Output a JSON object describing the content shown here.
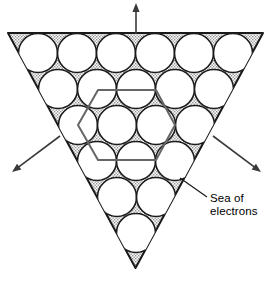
{
  "figure": {
    "background_color": "#ffffff",
    "outline_color": "#1a1a1a",
    "sea_fill_color": "#a8a8a8",
    "sea_fill_description": "stippled gray shading filling gaps between atoms",
    "atom_fill_color": "#ffffff",
    "unit_cell_color": "#666666",
    "arrow_color": "#3a3a3a"
  },
  "triangle": {
    "orientation": "inverted",
    "vertices": [
      {
        "x": 8,
        "y": 33
      },
      {
        "x": 263,
        "y": 33
      },
      {
        "x": 135.5,
        "y": 268
      }
    ]
  },
  "lattice": {
    "description": "close-packed hexagonal array of metal atoms",
    "radius": 19.5,
    "row_spacing": 34,
    "rows": [
      {
        "count": 6,
        "y": 53,
        "cx": [
          38,
          77,
          116,
          155,
          194,
          233
        ]
      },
      {
        "count": 5,
        "y": 89,
        "cx": [
          58,
          97,
          136,
          175,
          214
        ]
      },
      {
        "count": 4,
        "y": 125,
        "cx": [
          78,
          117,
          156,
          195
        ]
      },
      {
        "count": 3,
        "y": 161,
        "cx": [
          97,
          136,
          175
        ]
      },
      {
        "count": 2,
        "y": 197,
        "cx": [
          117,
          156
        ]
      },
      {
        "count": 1,
        "y": 233,
        "cx": [
          136
        ]
      }
    ],
    "total_atoms": 21
  },
  "unit_cell": {
    "label": "hexagonal unit cell",
    "shape": "flat-top-hexagon",
    "center": {
      "x": 117,
      "y": 125
    },
    "radius": 39,
    "points": "98,90 156,90 175,125 156,160 98,160 78,125"
  },
  "arrows": [
    {
      "name": "arrow-up",
      "direction": "up",
      "tail": {
        "x": 136,
        "y": 34
      },
      "head": {
        "x": 136,
        "y": 3
      }
    },
    {
      "name": "arrow-down-left",
      "direction": "down-left",
      "tail": {
        "x": 60,
        "y": 136
      },
      "head": {
        "x": 12,
        "y": 172
      }
    },
    {
      "name": "arrow-down-right",
      "direction": "down-right",
      "tail": {
        "x": 213,
        "y": 136
      },
      "head": {
        "x": 261,
        "y": 172
      }
    }
  ],
  "callout": {
    "line1": "Sea of",
    "line2": "electrons",
    "leader_line": {
      "from": {
        "x": 207,
        "y": 197
      },
      "to": {
        "x": 180,
        "y": 178
      }
    }
  }
}
